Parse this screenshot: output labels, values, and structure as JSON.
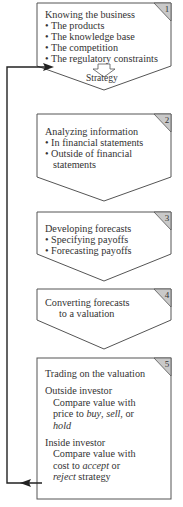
{
  "colors": {
    "stroke": "#555555",
    "tab_fill": "#c9c9c9",
    "background": "#ffffff",
    "arrow": "#222222"
  },
  "steps": [
    {
      "number": "1",
      "title": "Knowing the business",
      "bullets": [
        "• The products",
        "• The knowledge base",
        "• The competition",
        "• The regulatory constraints"
      ],
      "output": "Strategy"
    },
    {
      "number": "2",
      "title": "Analyzing information",
      "bullets": [
        "• In financial statements",
        "• Outside of financial",
        "statements"
      ]
    },
    {
      "number": "3",
      "title": "Developing forecasts",
      "bullets": [
        "• Specifying payoffs",
        "• Forecasting payoffs"
      ]
    },
    {
      "number": "4",
      "title_lines": [
        "Converting forecasts",
        "to a valuation"
      ]
    },
    {
      "number": "5",
      "title": "Trading on the valuation",
      "outside": {
        "heading": "Outside investor",
        "line1": "Compare value with",
        "line2_pre": "price to ",
        "buy": "buy",
        "sep1": ", ",
        "sell": "sell",
        "sep2": ", or",
        "hold": "hold"
      },
      "inside": {
        "heading": "Inside investor",
        "line1": "Compare value with",
        "line2_pre": "cost to ",
        "accept": "accept",
        "line2_post": " or",
        "reject": "reject",
        "line3_post": " strategy"
      }
    }
  ],
  "feedback_loop": {
    "from": "step-5",
    "to": "step-1"
  }
}
